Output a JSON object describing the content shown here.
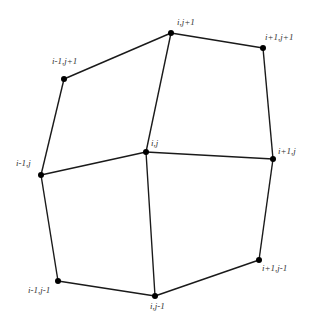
{
  "diagram": {
    "title": "",
    "nodes": [
      {
        "id": "i,j",
        "label": "i,j",
        "x": 146,
        "y": 152,
        "lx": 151,
        "ly": 146
      },
      {
        "id": "i+1,j",
        "label": "i+1,j",
        "x": 273,
        "y": 159,
        "lx": 278,
        "ly": 154
      },
      {
        "id": "i-1,j",
        "label": "i-1,j",
        "x": 41,
        "y": 175,
        "lx": 16,
        "ly": 166
      },
      {
        "id": "i,j+1",
        "label": "i,j+1",
        "x": 171,
        "y": 33,
        "lx": 177,
        "ly": 25
      },
      {
        "id": "i,j-1",
        "label": "i,j-1",
        "x": 155,
        "y": 296,
        "lx": 150,
        "ly": 309
      },
      {
        "id": "i+1,j+1",
        "label": "i+1,j+1",
        "x": 263,
        "y": 48,
        "lx": 265,
        "ly": 40
      },
      {
        "id": "i-1,j+1",
        "label": "i-1,j+1",
        "x": 64,
        "y": 79,
        "lx": 52,
        "ly": 64
      },
      {
        "id": "i-1,j-1",
        "label": "i-1,j-1",
        "x": 58,
        "y": 281,
        "lx": 28,
        "ly": 293
      },
      {
        "id": "i+1,j-1",
        "label": "i+1,j-1",
        "x": 259,
        "y": 260,
        "lx": 262,
        "ly": 271
      }
    ],
    "edges": [
      [
        "i,j",
        "i+1,j"
      ],
      [
        "i,j",
        "i-1,j"
      ],
      [
        "i,j",
        "i,j+1"
      ],
      [
        "i,j",
        "i,j-1"
      ],
      [
        "i,j+1",
        "i+1,j+1"
      ],
      [
        "i+1,j+1",
        "i+1,j"
      ],
      [
        "i+1,j",
        "i+1,j-1"
      ],
      [
        "i+1,j-1",
        "i,j-1"
      ],
      [
        "i,j-1",
        "i-1,j-1"
      ],
      [
        "i-1,j-1",
        "i-1,j"
      ],
      [
        "i-1,j",
        "i-1,j+1"
      ],
      [
        "i-1,j+1",
        "i,j+1"
      ]
    ],
    "colors": {
      "line": "#1a1a1a",
      "node": "#000000",
      "label": "#333333",
      "background": "#ffffff"
    },
    "node_radius": 3
  }
}
